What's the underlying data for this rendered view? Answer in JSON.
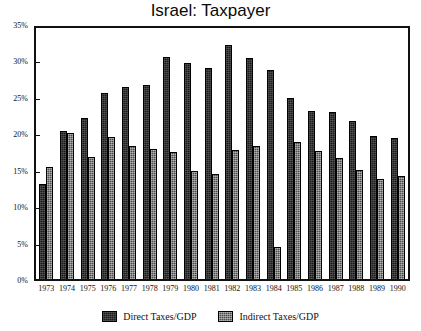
{
  "chart_data": {
    "type": "bar",
    "title": "Israel: Taxpayer",
    "xlabel": "",
    "ylabel": "",
    "ylim": [
      0,
      35
    ],
    "ytick_labels": [
      "0%",
      "5%",
      "10%",
      "15%",
      "20%",
      "25%",
      "30%",
      "35%"
    ],
    "ytick_values": [
      0,
      5,
      10,
      15,
      20,
      25,
      30,
      35
    ],
    "grid": false,
    "legend_position": "bottom",
    "categories": [
      "1973",
      "1974",
      "1975",
      "1976",
      "1977",
      "1978",
      "1979",
      "1980",
      "1981",
      "1982",
      "1983",
      "1984",
      "1985",
      "1986",
      "1987",
      "1988",
      "1989",
      "1990"
    ],
    "series": [
      {
        "name": "Direct Taxes/GDP",
        "color": "#1b1b1b",
        "values": [
          13.2,
          20.7,
          22.5,
          25.9,
          26.8,
          27.0,
          31.0,
          30.1,
          29.4,
          32.7,
          30.8,
          29.2,
          25.3,
          23.4,
          23.3,
          22.0,
          19.9,
          19.6
        ]
      },
      {
        "name": "Indirect Taxes/GDP",
        "color": "#4a4a4a",
        "values": [
          15.6,
          20.3,
          17.0,
          19.8,
          18.6,
          18.1,
          17.7,
          15.0,
          14.6,
          18.0,
          18.5,
          4.4,
          19.1,
          17.9,
          16.9,
          15.2,
          13.9,
          14.3
        ]
      }
    ]
  },
  "legend": {
    "items": [
      {
        "label": "Direct Taxes/GDP"
      },
      {
        "label": "Indirect Taxes/GDP"
      }
    ]
  }
}
